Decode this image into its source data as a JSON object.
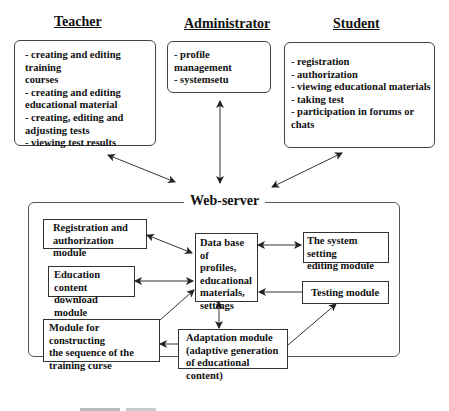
{
  "actors": {
    "teacher": {
      "title": "Teacher",
      "items": [
        "- creating and editing training",
        "courses",
        "- creating and editing",
        "educational material",
        "- creating, editing and",
        "adjusting tests",
        "- viewing test results"
      ]
    },
    "administrator": {
      "title": "Administrator",
      "items": [
        "- profile management",
        "- systemsetu"
      ]
    },
    "student": {
      "title": "Student",
      "items": [
        "- registration",
        "- authorization",
        "- viewing educational materials",
        "- taking test",
        "- participation in forums or chats"
      ]
    }
  },
  "server": {
    "label": "Web-server",
    "modules": {
      "registration": [
        "Registration and",
        "authorization module"
      ],
      "education_content": [
        "Education content",
        "download module"
      ],
      "sequence": [
        "Module for constructing",
        "the sequence of the",
        "training curse"
      ],
      "database": [
        "Data base of",
        "profiles,",
        "educational",
        "materials,",
        "settings"
      ],
      "system_setting": [
        "The system setting",
        "editing module"
      ],
      "testing": [
        "Testing module"
      ],
      "adaptation": [
        "Adaptation module",
        "(adaptive generation",
        "of educational content)"
      ]
    }
  },
  "colors": {
    "line": "#333333",
    "border": "#444444",
    "background": "#ffffff"
  }
}
